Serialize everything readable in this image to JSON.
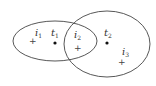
{
  "diagram": {
    "ellipses": [
      {
        "name": "left-region",
        "cx": 55,
        "cy": 41,
        "rx": 42,
        "ry": 20,
        "stroke": "#444444"
      },
      {
        "name": "right-region",
        "cx": 107,
        "cy": 44,
        "rx": 43,
        "ry": 33,
        "stroke": "#444444"
      }
    ],
    "points": [
      {
        "type": "plus",
        "x": 32,
        "y": 41,
        "label": "i",
        "sub": "1",
        "lx": 36,
        "ly": 35
      },
      {
        "type": "dot",
        "x": 55,
        "y": 43,
        "label": "t",
        "sub": "1",
        "lx": 51,
        "ly": 35
      },
      {
        "type": "plus",
        "x": 77,
        "y": 48,
        "label": "i",
        "sub": "2",
        "lx": 74,
        "ly": 37
      },
      {
        "type": "dot",
        "x": 107,
        "y": 43,
        "label": "t",
        "sub": "2",
        "lx": 104,
        "ly": 35
      },
      {
        "type": "plus",
        "x": 121,
        "y": 62,
        "label": "i",
        "sub": "3",
        "lx": 122,
        "ly": 54
      }
    ]
  },
  "labels": {
    "i1": "i",
    "i1_sub": "1",
    "t1": "t",
    "t1_sub": "1",
    "i2": "i",
    "i2_sub": "2",
    "t2": "t",
    "t2_sub": "2",
    "i3": "i",
    "i3_sub": "3",
    "plus": "+"
  }
}
